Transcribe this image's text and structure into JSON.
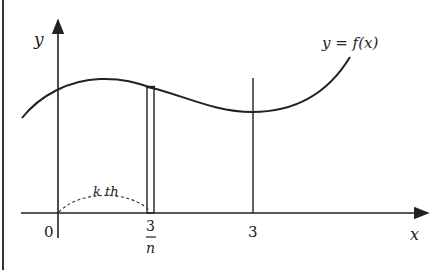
{
  "diagram": {
    "axis_labels": {
      "y": "y",
      "x": "x",
      "origin": "0"
    },
    "curve_label": "y = f(x)",
    "tick_labels": {
      "three_over_n_numerator": "3",
      "three_over_n_denominator": "n",
      "three": "3"
    },
    "strip_label": "k th",
    "colors": {
      "stroke": "#222222",
      "background": "#ffffff"
    }
  }
}
